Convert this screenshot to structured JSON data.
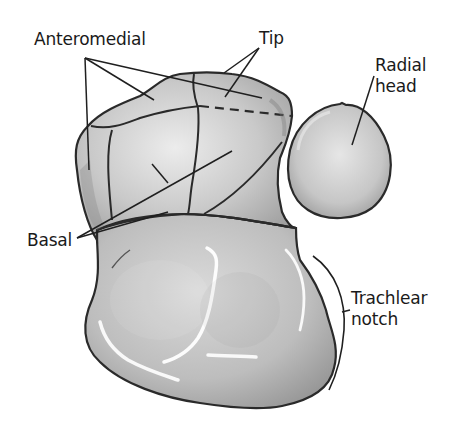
{
  "figure": {
    "labels": {
      "anteromedial": "Anteromedial",
      "tip": "Tip",
      "radial_head": [
        "Radial",
        "head"
      ],
      "basal": "Basal",
      "trochlear_notch": [
        "Trachlear",
        "notch"
      ]
    },
    "structures": [
      "coronoid-process",
      "radial-head",
      "trochlear-notch-body"
    ],
    "colors": {
      "outline": "#2a2a2a",
      "bone_fill_light": "#d6d6d6",
      "bone_fill_mid": "#b8b8b8",
      "bone_fill_dark": "#9a9a9a",
      "highlight": "#ffffff",
      "leader_line": "#1f1f1f",
      "background": "#ffffff"
    }
  }
}
